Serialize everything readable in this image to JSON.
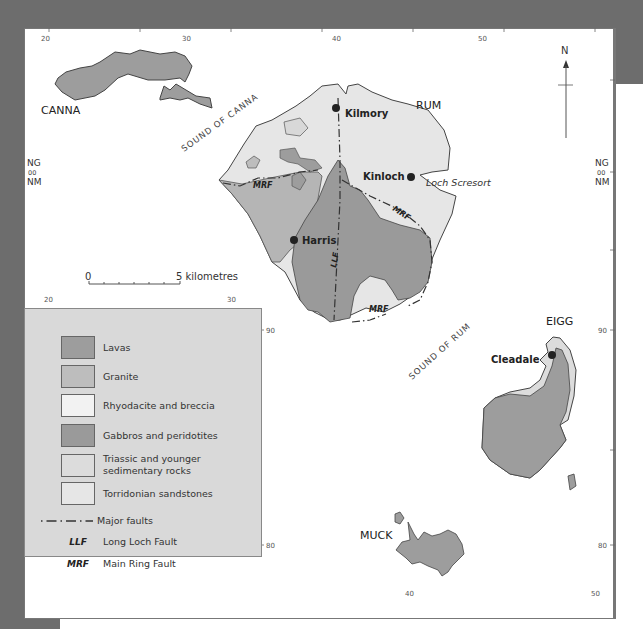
{
  "map": {
    "grid": {
      "top_labels": [
        "20",
        "30",
        "40",
        "50"
      ],
      "inner_labels": [
        "20",
        "30"
      ],
      "bottom_labels": [
        "40",
        "50"
      ],
      "left_labels": [
        "NG",
        "00",
        "NM"
      ],
      "right_labels": [
        "NG",
        "00",
        "NM"
      ],
      "right_ticks": [
        "90",
        "80"
      ],
      "inner_ticks": [
        "90",
        "80"
      ]
    },
    "north_arrow": "N",
    "scale": {
      "start": "0",
      "end": "5 kilometres"
    },
    "islands": [
      "CANNA",
      "RUM",
      "EIGG",
      "MUCK"
    ],
    "sea_labels": [
      "SOUND OF CANNA",
      "SOUND OF RUM"
    ],
    "settlements": [
      "Kilmory",
      "Kinloch",
      "Harris",
      "Cleadale"
    ],
    "features": [
      "Loch Scresort"
    ],
    "fault_labels": {
      "mrf": "MRF",
      "llf": "LLF"
    },
    "colors": {
      "lavas": "#9d9d9d",
      "granite": "#bdbdbd",
      "rhyodacite": "#f0f0f0",
      "gabbros": "#9a9a9a",
      "triassic": "#dcdcdc",
      "torridonian": "#e8e8e8",
      "legend_bg": "#d9d9d9",
      "page_bg": "#6d6d6d"
    }
  },
  "legend": {
    "items": [
      {
        "label": "Lavas",
        "color": "#9d9d9d"
      },
      {
        "label": "Granite",
        "color": "#bdbdbd"
      },
      {
        "label": "Rhyodacite and breccia",
        "color": "#f2f2f2"
      },
      {
        "label": "Gabbros and peridotites",
        "color": "#9a9a9a"
      },
      {
        "label_line1": "Triassic and younger",
        "label_line2": "sedimentary rocks",
        "color": "#dcdcdc"
      },
      {
        "label": "Torridonian sandstones",
        "color": "#e6e6e6"
      }
    ],
    "symbols": [
      {
        "symbol": "— · —",
        "label": "Major faults"
      },
      {
        "symbol": "LLF",
        "label": "Long Loch Fault"
      },
      {
        "symbol": "MRF",
        "label": "Main Ring Fault"
      }
    ]
  }
}
